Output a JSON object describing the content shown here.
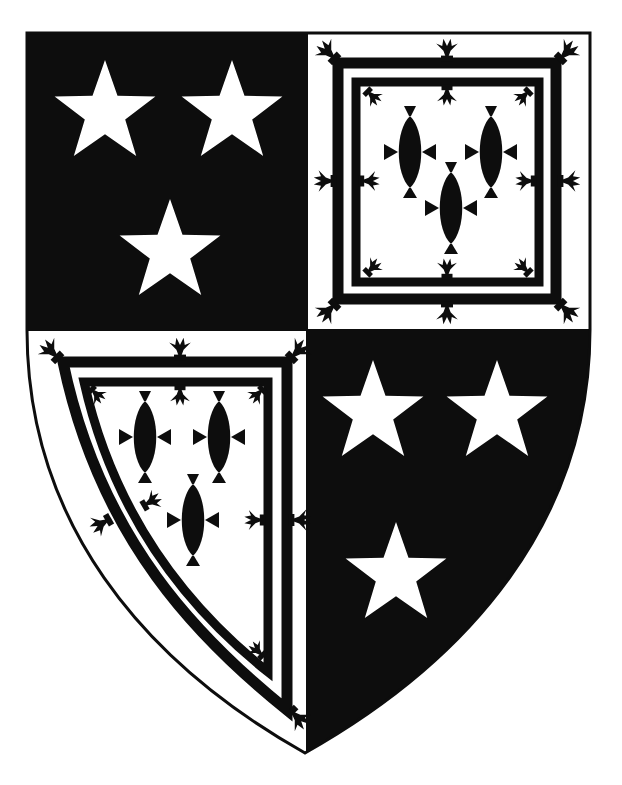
{
  "image": {
    "type": "heraldic-shield",
    "width": 622,
    "height": 785,
    "background": "#ffffff"
  },
  "colors": {
    "sable": "#0d0d0d",
    "argent": "#ffffff"
  },
  "shield": {
    "outline": "M27,33 L590,33 L590,330 C590,520 470,660 305,753 C140,660 27,520 27,330 Z",
    "division_x": 307,
    "division_y": 330,
    "quarters": [
      {
        "position": "top-left",
        "field": "sable",
        "charge": "mullet",
        "charge_color": "argent",
        "count": 3,
        "stars": [
          {
            "cx": 105,
            "cy": 113,
            "r": 53
          },
          {
            "cx": 232,
            "cy": 113,
            "r": 53
          },
          {
            "cx": 170,
            "cy": 252,
            "r": 53
          }
        ]
      },
      {
        "position": "top-right",
        "field": "argent",
        "charge": "fish-naiant-in-pale",
        "charge_color": "sable",
        "count": 3,
        "border": "double-tressure-flory-counter-flory",
        "fish": [
          {
            "cx": 410,
            "cy": 152
          },
          {
            "cx": 491,
            "cy": 152
          },
          {
            "cx": 451,
            "cy": 208
          }
        ]
      },
      {
        "position": "bottom-left",
        "field": "argent",
        "charge": "fish-naiant-in-pale",
        "charge_color": "sable",
        "count": 3,
        "border": "double-tressure-flory-counter-flory",
        "fish": [
          {
            "cx": 145,
            "cy": 437
          },
          {
            "cx": 219,
            "cy": 437
          },
          {
            "cx": 193,
            "cy": 520
          }
        ]
      },
      {
        "position": "bottom-right",
        "field": "sable",
        "charge": "mullet",
        "charge_color": "argent",
        "count": 3,
        "stars": [
          {
            "cx": 373,
            "cy": 413,
            "r": 53
          },
          {
            "cx": 497,
            "cy": 413,
            "r": 53
          },
          {
            "cx": 396,
            "cy": 575,
            "r": 53
          }
        ]
      }
    ]
  },
  "labels": {
    "title": "Quarterly coat of arms"
  }
}
